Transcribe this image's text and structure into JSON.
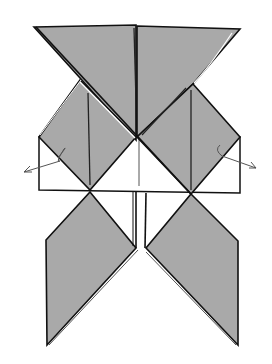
{
  "diagram": {
    "type": "origami-folding-step",
    "colors": {
      "paper_color": "#a9a9a9",
      "paper_back": "#ffffff",
      "line": "#111111",
      "arrow": "#555555",
      "background": "#ffffff"
    },
    "arrows": [
      {
        "name": "left-fold-arrow",
        "direction": "down-left"
      },
      {
        "name": "right-fold-arrow",
        "direction": "down-right"
      }
    ]
  }
}
